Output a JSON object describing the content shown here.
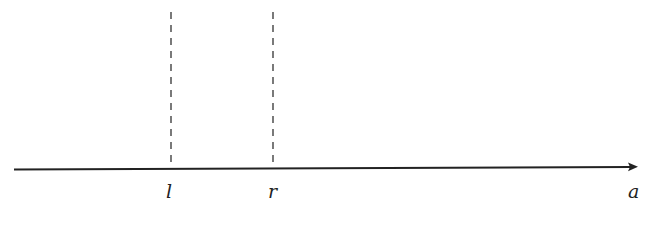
{
  "diagram": {
    "type": "number-line",
    "axis": {
      "label": "a",
      "arrow": "right",
      "color": "#222222"
    },
    "markers": [
      {
        "label": "l",
        "x": 171,
        "style": "dashed"
      },
      {
        "label": "r",
        "x": 273,
        "style": "dashed"
      }
    ],
    "caption": ""
  }
}
